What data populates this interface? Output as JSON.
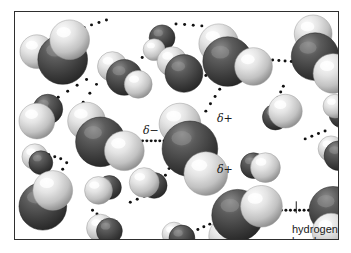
{
  "figure": {
    "kind": "space-filling-molecular-diagram",
    "background_color": "#ffffff",
    "frame": {
      "border_color": "#2e2e2e",
      "x": 14,
      "y": 11,
      "width": 325,
      "height": 229
    }
  },
  "palette": {
    "oxygen_dark": "#3b3b3b",
    "oxygen_mid": "#555555",
    "oxygen_highlight": "#8f8f8f",
    "hydrogen_light": "#e9e9e9",
    "hydrogen_mid": "#b9b9b9",
    "hydrogen_shadow": "#8c8c8c",
    "bond_dot": "#111111",
    "text": "#1a1a1a"
  },
  "labels": {
    "delta_negative": "δ−",
    "delta_positive_upper": "δ+",
    "delta_positive_lower": "δ+",
    "hydrogen_bond_line1": "hydrogen",
    "hydrogen_bond_line2": "bond"
  },
  "label_positions": {
    "delta_negative": {
      "x": 128,
      "y": 113
    },
    "delta_positive_upper": {
      "x": 202,
      "y": 101
    },
    "delta_positive_lower": {
      "x": 202,
      "y": 152
    },
    "hydrogen_bond": {
      "x": 277,
      "y": 212
    }
  },
  "molecules": [
    {
      "id": "m1",
      "ox": 48,
      "oy": 48,
      "or": 25,
      "h": [
        {
          "x": 22,
          "y": 40,
          "r": 17,
          "z": "back"
        },
        {
          "x": 55,
          "y": 28,
          "r": 20,
          "z": "front"
        }
      ]
    },
    {
      "id": "m2",
      "ox": 110,
      "oy": 66,
      "or": 18,
      "h": [
        {
          "x": 98,
          "y": 55,
          "r": 15,
          "z": "back"
        },
        {
          "x": 124,
          "y": 73,
          "r": 14,
          "z": "front"
        }
      ]
    },
    {
      "id": "m3",
      "ox": 148,
      "oy": 26,
      "or": 13,
      "h": [
        {
          "x": 140,
          "y": 38,
          "r": 11,
          "z": "front"
        }
      ]
    },
    {
      "id": "m4",
      "ox": 170,
      "oy": 62,
      "or": 19,
      "h": [
        {
          "x": 158,
          "y": 50,
          "r": 15,
          "z": "back"
        }
      ]
    },
    {
      "id": "m5",
      "ox": 214,
      "oy": 50,
      "or": 25,
      "h": [
        {
          "x": 205,
          "y": 32,
          "r": 20,
          "z": "back"
        },
        {
          "x": 240,
          "y": 55,
          "r": 19,
          "z": "front"
        }
      ]
    },
    {
      "id": "m6",
      "ox": 302,
      "oy": 45,
      "or": 24,
      "h": [
        {
          "x": 300,
          "y": 22,
          "r": 19,
          "z": "back"
        },
        {
          "x": 320,
          "y": 62,
          "r": 20,
          "z": "front"
        }
      ]
    },
    {
      "id": "m7",
      "ox": 33,
      "oy": 98,
      "or": 15,
      "h": [
        {
          "x": 22,
          "y": 110,
          "r": 18,
          "z": "front"
        }
      ]
    },
    {
      "id": "m8",
      "ox": 86,
      "oy": 131,
      "or": 25,
      "h": [
        {
          "x": 72,
          "y": 110,
          "r": 19,
          "z": "back"
        },
        {
          "x": 110,
          "y": 140,
          "r": 20,
          "z": "front"
        }
      ]
    },
    {
      "id": "m9",
      "ox": 176,
      "oy": 138,
      "or": 28,
      "h": [
        {
          "x": 166,
          "y": 113,
          "r": 21,
          "z": "back"
        },
        {
          "x": 192,
          "y": 163,
          "r": 22,
          "z": "front"
        }
      ]
    },
    {
      "id": "m10",
      "ox": 262,
      "oy": 106,
      "or": 13,
      "h": [
        {
          "x": 272,
          "y": 100,
          "r": 17,
          "z": "front"
        }
      ]
    },
    {
      "id": "m11",
      "ox": 330,
      "oy": 103,
      "or": 14,
      "h": [
        {
          "x": 322,
          "y": 95,
          "r": 12,
          "z": "front"
        }
      ]
    },
    {
      "id": "m12",
      "ox": 26,
      "oy": 152,
      "or": 12,
      "h": [
        {
          "x": 20,
          "y": 146,
          "r": 13,
          "z": "back"
        }
      ]
    },
    {
      "id": "m13",
      "ox": 240,
      "oy": 155,
      "or": 13,
      "h": [
        {
          "x": 252,
          "y": 157,
          "r": 15,
          "z": "front"
        }
      ]
    },
    {
      "id": "m14",
      "ox": 326,
      "oy": 145,
      "or": 15,
      "h": [
        {
          "x": 318,
          "y": 138,
          "r": 13,
          "z": "back"
        }
      ]
    },
    {
      "id": "m15",
      "ox": 28,
      "oy": 196,
      "or": 24,
      "h": [
        {
          "x": 38,
          "y": 180,
          "r": 20,
          "z": "front"
        }
      ]
    },
    {
      "id": "m16",
      "ox": 95,
      "oy": 177,
      "or": 12,
      "h": [
        {
          "x": 84,
          "y": 180,
          "r": 14,
          "z": "front"
        }
      ]
    },
    {
      "id": "m17",
      "ox": 140,
      "oy": 175,
      "or": 13,
      "h": [
        {
          "x": 130,
          "y": 172,
          "r": 15,
          "z": "front"
        }
      ]
    },
    {
      "id": "m18",
      "ox": 95,
      "oy": 221,
      "or": 13,
      "h": [
        {
          "x": 86,
          "y": 218,
          "r": 14,
          "z": "back"
        }
      ]
    },
    {
      "id": "m19",
      "ox": 224,
      "oy": 205,
      "or": 26,
      "h": [
        {
          "x": 215,
          "y": 226,
          "r": 20,
          "z": "back"
        },
        {
          "x": 248,
          "y": 196,
          "r": 21,
          "z": "front"
        }
      ]
    },
    {
      "id": "m20",
      "ox": 320,
      "oy": 200,
      "or": 24,
      "h": [
        {
          "x": 318,
          "y": 222,
          "r": 19,
          "z": "front"
        }
      ]
    },
    {
      "id": "m21",
      "ox": 168,
      "oy": 228,
      "or": 13,
      "h": [
        {
          "x": 160,
          "y": 224,
          "r": 12,
          "z": "back"
        }
      ]
    }
  ],
  "hydrogen_bonds": [
    {
      "id": "hb1",
      "from": [
        72,
        68
      ],
      "to": [
        34,
        92
      ],
      "dots": 5
    },
    {
      "id": "hb2",
      "from": [
        82,
        73
      ],
      "to": [
        62,
        100
      ],
      "dots": 4
    },
    {
      "id": "hb3",
      "from": [
        62,
        18
      ],
      "to": [
        92,
        8
      ],
      "dots": 5
    },
    {
      "id": "hb4",
      "from": [
        128,
        46
      ],
      "to": [
        150,
        22
      ],
      "dots": 4
    },
    {
      "id": "hb5",
      "from": [
        162,
        12
      ],
      "to": [
        188,
        14
      ],
      "dots": 4
    },
    {
      "id": "hb6",
      "from": [
        192,
        64
      ],
      "to": [
        176,
        76
      ],
      "dots": 3
    },
    {
      "id": "hb7",
      "from": [
        206,
        78
      ],
      "to": [
        192,
        100
      ],
      "dots": 4
    },
    {
      "id": "hb8",
      "from": [
        253,
        48
      ],
      "to": [
        278,
        50
      ],
      "dots": 5
    },
    {
      "id": "hb9",
      "from": [
        270,
        75
      ],
      "to": [
        262,
        92
      ],
      "dots": 4
    },
    {
      "id": "hb10",
      "from": [
        124,
        130
      ],
      "to": [
        150,
        130
      ],
      "dots": 7
    },
    {
      "id": "hb11",
      "from": [
        155,
        158
      ],
      "to": [
        144,
        178
      ],
      "dots": 4
    },
    {
      "id": "hb12",
      "from": [
        46,
        148
      ],
      "to": [
        22,
        140
      ],
      "dots": 5
    },
    {
      "id": "hb13",
      "from": [
        52,
        152
      ],
      "to": [
        40,
        172
      ],
      "dots": 4
    },
    {
      "id": "hb14",
      "from": [
        78,
        200
      ],
      "to": [
        96,
        215
      ],
      "dots": 5
    },
    {
      "id": "hb15",
      "from": [
        178,
        222
      ],
      "to": [
        196,
        214
      ],
      "dots": 4
    },
    {
      "id": "hb16",
      "from": [
        268,
        200
      ],
      "to": [
        300,
        200
      ],
      "dots": 8
    },
    {
      "id": "hb17",
      "from": [
        300,
        200
      ],
      "to": [
        330,
        200
      ],
      "dots": 7
    },
    {
      "id": "hb18",
      "from": [
        292,
        128
      ],
      "to": [
        312,
        120
      ],
      "dots": 4
    },
    {
      "id": "hb19",
      "from": [
        116,
        192
      ],
      "to": [
        130,
        186
      ],
      "dots": 3
    }
  ],
  "leader_line": {
    "x": 297,
    "y1": 202,
    "y2": 214,
    "color": "#1a1a1a"
  }
}
